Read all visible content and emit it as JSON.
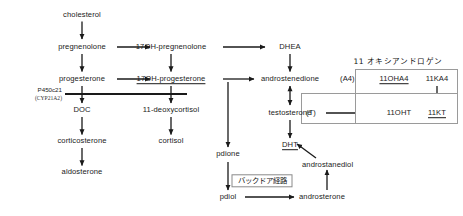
{
  "diagram": {
    "background": "#ffffff",
    "ink": "#1a1a1a"
  },
  "nodes": {
    "cholesterol": "cholesterol",
    "pregnenolone": "pregnenolone",
    "progesterone": "progesterone",
    "doc": "DOC",
    "corticosterone": "corticosterone",
    "aldosterone": "aldosterone",
    "oh_pregnenolone": "17OH-pregnenolone",
    "oh_progesterone": "17OH-progesterone",
    "deoxycortisol": "11-deoxycortisol",
    "cortisol": "cortisol",
    "pdione": "pdione",
    "pdiol": "pdiol",
    "dhea": "DHEA",
    "androstenedione": "androstenedione",
    "testosterone": "testosterone",
    "dht": "DHT",
    "androstanediol": "androstanediol",
    "androsterone": "androsterone",
    "a4_tag": "(A4)",
    "t_tag": "(T)",
    "oh_a4": "11OHA4",
    "k_a4": "11KA4",
    "oh_t": "11OHT",
    "k_t": "11KT"
  },
  "labels": {
    "enzyme_name": "P450c21",
    "enzyme_gene": "(CYP21A2)",
    "oxyandrogen_heading": "11 オキシアンドロゲン",
    "backdoor_pathway": "バックドア経路"
  }
}
